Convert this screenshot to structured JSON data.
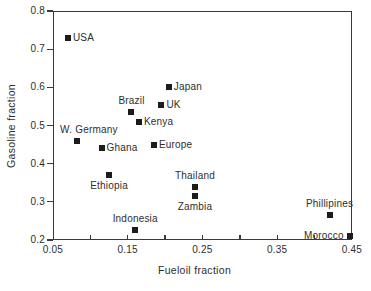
{
  "figure": {
    "background_color": "#ffffff",
    "ink_color": "#3a3a3a",
    "marker_color": "#1c1c1c"
  },
  "chart_data": {
    "type": "scatter",
    "title": "",
    "xlabel": "Fueloil fraction",
    "ylabel": "Gasoline fraction",
    "xlim": [
      0.05,
      0.45
    ],
    "ylim": [
      0.2,
      0.8
    ],
    "grid": false,
    "legend": "none",
    "marker": {
      "shape": "filled-square",
      "size_px": 6
    },
    "x_ticks": [
      {
        "value": 0.05,
        "label": "0.05"
      },
      {
        "value": 0.15,
        "label": "0.15"
      },
      {
        "value": 0.25,
        "label": "0.25"
      },
      {
        "value": 0.35,
        "label": "0.35"
      },
      {
        "value": 0.45,
        "label": "0.45"
      }
    ],
    "x_tick_marks": [
      0.1,
      0.15,
      0.2,
      0.25,
      0.3,
      0.35,
      0.4
    ],
    "y_ticks": [
      {
        "value": 0.2,
        "label": "0.2"
      },
      {
        "value": 0.3,
        "label": "0.3"
      },
      {
        "value": 0.4,
        "label": "0.4"
      },
      {
        "value": 0.5,
        "label": "0.5"
      },
      {
        "value": 0.6,
        "label": "0.6"
      },
      {
        "value": 0.7,
        "label": "0.7"
      },
      {
        "value": 0.8,
        "label": "0.8"
      }
    ],
    "points": [
      {
        "label": "USA",
        "x": 0.07,
        "y": 0.73,
        "label_pos": "right"
      },
      {
        "label": "W. Germany",
        "x": 0.082,
        "y": 0.46,
        "label_pos": "above",
        "dx": 12
      },
      {
        "label": "Ghana",
        "x": 0.115,
        "y": 0.44,
        "label_pos": "right"
      },
      {
        "label": "Ethiopia",
        "x": 0.125,
        "y": 0.37,
        "label_pos": "below"
      },
      {
        "label": "Brazil",
        "x": 0.155,
        "y": 0.535,
        "label_pos": "above"
      },
      {
        "label": "Indonesia",
        "x": 0.16,
        "y": 0.225,
        "label_pos": "above"
      },
      {
        "label": "Kenya",
        "x": 0.165,
        "y": 0.51,
        "label_pos": "right"
      },
      {
        "label": "Europe",
        "x": 0.185,
        "y": 0.45,
        "label_pos": "right"
      },
      {
        "label": "UK",
        "x": 0.195,
        "y": 0.555,
        "label_pos": "right"
      },
      {
        "label": "Japan",
        "x": 0.205,
        "y": 0.6,
        "label_pos": "right"
      },
      {
        "label": "Thailand",
        "x": 0.24,
        "y": 0.34,
        "label_pos": "above"
      },
      {
        "label": "Zambia",
        "x": 0.24,
        "y": 0.315,
        "label_pos": "below"
      },
      {
        "label": "Phillipines",
        "x": 0.42,
        "y": 0.265,
        "label_pos": "above"
      },
      {
        "label": "Morocco",
        "x": 0.447,
        "y": 0.21,
        "label_pos": "left"
      }
    ]
  }
}
